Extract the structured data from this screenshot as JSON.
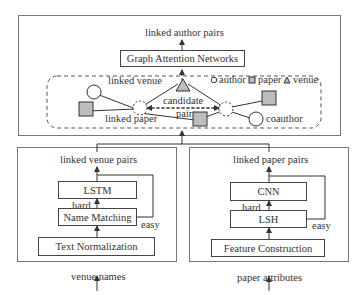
{
  "top_module": {
    "output_label": "linked author pairs",
    "model_box": "Graph Attention Networks",
    "graph": {
      "legend": [
        {
          "shape": "circle",
          "label": "author"
        },
        {
          "shape": "square",
          "label": "paper"
        },
        {
          "shape": "triangle",
          "label": "venue"
        }
      ],
      "edge_labels": {
        "linked_venue": "linked venue",
        "linked_paper": "linked paper",
        "candidate": "candidate",
        "pair": "pair",
        "coauthor": "coauthor"
      }
    }
  },
  "venue_module": {
    "output_label": "linked venue pairs",
    "boxes": [
      "LSTM",
      "Name Matching",
      "Text Normalization"
    ],
    "hard_label": "hard",
    "easy_label": "easy",
    "input_label": "venue names"
  },
  "paper_module": {
    "output_label": "linked paper pairs",
    "boxes": [
      "CNN",
      "LSH",
      "Feature Construction"
    ],
    "hard_label": "hard",
    "easy_label": "easy",
    "input_label": "paper attributes"
  },
  "colors": {
    "node_fill": "#bdbdbd",
    "stroke": "#444444"
  }
}
